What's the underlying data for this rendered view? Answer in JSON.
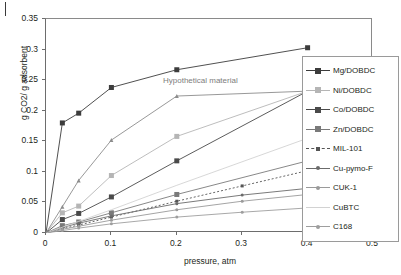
{
  "chart_data": {
    "type": "line",
    "title": "",
    "xlabel": "pressure, atm",
    "ylabel": "g CO2/ g adsorbent",
    "xlim": [
      0,
      0.5
    ],
    "ylim": [
      0,
      0.35
    ],
    "xticks": [
      "0",
      "0.1",
      "0.2",
      "0.3",
      "0.4",
      "0.5"
    ],
    "xtick_values": [
      0,
      0.1,
      0.2,
      0.3,
      0.4,
      0.5
    ],
    "yticks": [
      "0",
      "0.05",
      "0.1",
      "0.15",
      "0.2",
      "0.25",
      "0.3",
      "0.35"
    ],
    "ytick_values": [
      0,
      0.05,
      0.1,
      0.15,
      0.2,
      0.25,
      0.3,
      0.35
    ],
    "grid": false,
    "legend_position": "right",
    "annotations": [
      {
        "text": "Hypothetical material",
        "x": 0.2,
        "y": 0.235
      }
    ],
    "series": [
      {
        "name": "Mg/DOBDC",
        "color": "#3c3c3c",
        "marker": "square",
        "marker_size": 5,
        "dashed": false,
        "x": [
          0,
          0.025,
          0.05,
          0.1,
          0.2,
          0.4
        ],
        "y": [
          0,
          0.18,
          0.196,
          0.238,
          0.267,
          0.303
        ]
      },
      {
        "name": "Ni/DOBDC",
        "color": "#b5b5b5",
        "marker": "square",
        "marker_size": 5,
        "dashed": false,
        "x": [
          0,
          0.025,
          0.05,
          0.1,
          0.2,
          0.4
        ],
        "y": [
          0,
          0.033,
          0.044,
          0.094,
          0.158,
          0.232
        ]
      },
      {
        "name": "Co/DOBDC",
        "color": "#4a4a4a",
        "marker": "square",
        "marker_size": 5,
        "dashed": false,
        "x": [
          0,
          0.025,
          0.05,
          0.1,
          0.2,
          0.4
        ],
        "y": [
          0,
          0.022,
          0.032,
          0.059,
          0.118,
          0.232
        ]
      },
      {
        "name": "Zn/DOBDC",
        "color": "#7a7a7a",
        "marker": "square",
        "marker_size": 5,
        "dashed": false,
        "x": [
          0,
          0.025,
          0.05,
          0.1,
          0.2,
          0.4
        ],
        "y": [
          0,
          0.012,
          0.018,
          0.033,
          0.063,
          0.118
        ]
      },
      {
        "name": "MIL-101",
        "color": "#555555",
        "marker": "small-square",
        "marker_size": 3,
        "dashed": true,
        "x": [
          0,
          0.025,
          0.05,
          0.1,
          0.2,
          0.3,
          0.4
        ],
        "y": [
          0,
          0.007,
          0.013,
          0.026,
          0.052,
          0.077,
          0.102
        ]
      },
      {
        "name": "Cu-pymo-F",
        "color": "#6b6b6b",
        "marker": "dot",
        "marker_size": 3,
        "dashed": false,
        "x": [
          0,
          0.025,
          0.05,
          0.1,
          0.2,
          0.3,
          0.4
        ],
        "y": [
          0,
          0.009,
          0.016,
          0.028,
          0.048,
          0.062,
          0.073
        ]
      },
      {
        "name": "CUK-1",
        "color": "#9a9a9a",
        "marker": "dot",
        "marker_size": 3,
        "dashed": false,
        "x": [
          0,
          0.025,
          0.05,
          0.1,
          0.2,
          0.3,
          0.4
        ],
        "y": [
          0,
          0.006,
          0.011,
          0.021,
          0.038,
          0.052,
          0.063
        ]
      },
      {
        "name": "CuBTC",
        "color": "#d2d2d2",
        "marker": "none",
        "marker_size": 0,
        "dashed": false,
        "x": [
          0,
          0.05,
          0.1,
          0.2,
          0.4
        ],
        "y": [
          0,
          0.019,
          0.038,
          0.078,
          0.155
        ]
      },
      {
        "name": "C168",
        "color": "#9e9e9e",
        "marker": "dot",
        "marker_size": 3,
        "dashed": false,
        "x": [
          0,
          0.025,
          0.05,
          0.1,
          0.2,
          0.3,
          0.4
        ],
        "y": [
          0,
          0.004,
          0.008,
          0.015,
          0.026,
          0.034,
          0.041
        ]
      },
      {
        "name": "Hypothetical material",
        "color": "#8c8c8c",
        "marker": "triangle",
        "marker_size": 4,
        "dashed": false,
        "is_annotation_curve": true,
        "x": [
          0,
          0.025,
          0.05,
          0.1,
          0.2,
          0.5
        ],
        "y": [
          0,
          0.043,
          0.086,
          0.152,
          0.224,
          0.236
        ]
      }
    ]
  },
  "legend": {
    "items": [
      {
        "label": "Mg/DOBDC"
      },
      {
        "label": "Ni/DOBDC"
      },
      {
        "label": "Co/DOBDC"
      },
      {
        "label": "Zn/DOBDC"
      },
      {
        "label": "MIL-101"
      },
      {
        "label": "Cu-pymo-F"
      },
      {
        "label": "CUK-1"
      },
      {
        "label": "CuBTC"
      },
      {
        "label": "C168"
      }
    ]
  }
}
